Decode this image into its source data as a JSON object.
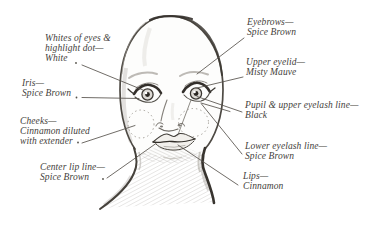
{
  "diagram": {
    "colors": {
      "ink": "#44413b",
      "leader": "#56524b",
      "pencil_dark": "#3c3833",
      "pencil_light": "#a9a5a0",
      "background": "#ffffff"
    },
    "labels": {
      "left": [
        {
          "id": "whites_of_eyes",
          "lines": [
            "Whites of eyes &",
            "highlight dot—",
            "White"
          ]
        },
        {
          "id": "iris",
          "lines": [
            "Iris—",
            "Spice Brown"
          ]
        },
        {
          "id": "cheeks",
          "lines": [
            "Cheeks—",
            "Cinnamon diluted",
            "with extender"
          ]
        },
        {
          "id": "center_lip_line",
          "lines": [
            "Center lip line—",
            "Spice Brown"
          ]
        }
      ],
      "right": [
        {
          "id": "eyebrows",
          "lines": [
            "Eyebrows—",
            "Spice Brown"
          ]
        },
        {
          "id": "upper_eyelid",
          "lines": [
            "Upper eyelid—",
            "Misty Mauve"
          ]
        },
        {
          "id": "pupil_upper_eyelash",
          "lines": [
            "Pupil & upper eyelash line—",
            "Black"
          ]
        },
        {
          "id": "lower_eyelash",
          "lines": [
            "Lower eyelash line—",
            "Spice Brown"
          ]
        },
        {
          "id": "lips",
          "lines": [
            "Lips—",
            "Cinnamon"
          ]
        }
      ]
    }
  }
}
